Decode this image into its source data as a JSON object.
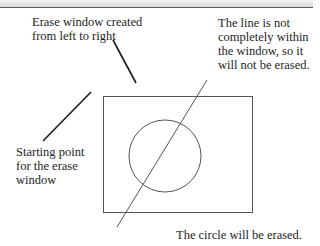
{
  "diagram": {
    "labels": {
      "erase_window": {
        "lines": [
          "Erase window created",
          "from left to right"
        ]
      },
      "line_note": {
        "lines": [
          "The line is not",
          "completely within",
          "the window, so it",
          "will not be erased."
        ]
      },
      "starting_point": {
        "lines": [
          "Starting point",
          "for the erase",
          "window"
        ]
      },
      "circle_note": {
        "lines": [
          "The circle will be erased."
        ]
      }
    },
    "shapes": {
      "erase_window_rect": {
        "x": 103,
        "y": 96,
        "width": 149,
        "height": 116
      },
      "circle": {
        "cx": 165,
        "cy": 156,
        "r": 36
      },
      "diagonal_line": {
        "x1": 207,
        "y1": 80,
        "x2": 117,
        "y2": 227
      },
      "pointer_erase_window": {
        "x1": 113,
        "y1": 40,
        "x2": 136,
        "y2": 83
      },
      "pointer_starting_point": {
        "x1": 91,
        "y1": 92,
        "x2": 43,
        "y2": 141
      }
    },
    "colors": {
      "shape_stroke": "#555555",
      "pointer_stroke": "#1a1a1a",
      "text": "#1e1e1e"
    }
  }
}
